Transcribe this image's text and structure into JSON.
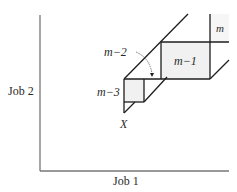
{
  "axes": {
    "x_label": "Job 1",
    "y_label": "Job 2"
  },
  "regions": {
    "m": "m",
    "m_minus_1": "m−1",
    "m_minus_2": "m−2",
    "m_minus_3": "m−3"
  },
  "points": {
    "start": "X"
  },
  "colors": {
    "line": "#1e1e1e",
    "shade": "#f1f1f1",
    "axis": "#777777"
  }
}
